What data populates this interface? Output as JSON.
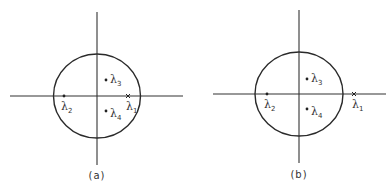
{
  "figure": {
    "panels": [
      {
        "id": "a",
        "caption": "(a)",
        "unit_circle": {
          "cx": 97,
          "cy": 96,
          "rx": 43.5,
          "ry": 42
        },
        "axes": {
          "x": {
            "x1": 10,
            "x2": 183,
            "y": 96
          },
          "y": {
            "x": 97,
            "y1": 12,
            "y2": 165
          }
        },
        "points": [
          {
            "label": "λ",
            "sub": "1",
            "marker": "cross",
            "x": 128,
            "y": 96,
            "label_dx": -2,
            "label_dy": 14,
            "position": "on circle boundary, real axis"
          },
          {
            "label": "λ",
            "sub": "2",
            "marker": "dot",
            "x": 64,
            "y": 96,
            "label_dx": -2,
            "label_dy": 14,
            "position": "inside circle, negative real axis"
          },
          {
            "label": "λ",
            "sub": "3",
            "marker": "dot",
            "x": 106,
            "y": 80,
            "label_dx": 4,
            "label_dy": 3,
            "position": "inside circle, upper half"
          },
          {
            "label": "λ",
            "sub": "4",
            "marker": "dot",
            "x": 106,
            "y": 111,
            "label_dx": 4,
            "label_dy": 6,
            "position": "inside circle, lower half"
          }
        ]
      },
      {
        "id": "b",
        "caption": "(b)",
        "unit_circle": {
          "cx": 299,
          "cy": 94,
          "rx": 44,
          "ry": 42
        },
        "axes": {
          "x": {
            "x1": 213,
            "x2": 386,
            "y": 94
          },
          "y": {
            "x": 299,
            "y1": 10,
            "y2": 163
          }
        },
        "points": [
          {
            "label": "λ",
            "sub": "1",
            "marker": "cross",
            "x": 354,
            "y": 94,
            "label_dx": -2,
            "label_dy": 14,
            "position": "outside circle, positive real axis"
          },
          {
            "label": "λ",
            "sub": "2",
            "marker": "dot",
            "x": 267,
            "y": 94,
            "label_dx": -2,
            "label_dy": 14,
            "position": "inside circle, negative real axis"
          },
          {
            "label": "λ",
            "sub": "3",
            "marker": "dot",
            "x": 307,
            "y": 79,
            "label_dx": 4,
            "label_dy": 3,
            "position": "inside circle, upper half"
          },
          {
            "label": "λ",
            "sub": "4",
            "marker": "dot",
            "x": 307,
            "y": 109,
            "label_dx": 4,
            "label_dy": 6,
            "position": "inside circle, lower half"
          }
        ]
      }
    ],
    "captions": {
      "a": "(a)",
      "b": "(b)"
    },
    "labels": {
      "a_l1": "λ",
      "a_l1_sub": "1",
      "a_l2": "λ",
      "a_l2_sub": "2",
      "a_l3": "λ",
      "a_l3_sub": "3",
      "a_l4": "λ",
      "a_l4_sub": "4",
      "b_l1": "λ",
      "b_l1_sub": "1",
      "b_l2": "λ",
      "b_l2_sub": "2",
      "b_l3": "λ",
      "b_l3_sub": "3",
      "b_l4": "λ",
      "b_l4_sub": "4"
    }
  }
}
